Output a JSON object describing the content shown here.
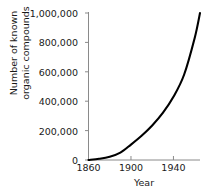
{
  "chart_data": {
    "type": "line",
    "title": "",
    "xlabel": "Year",
    "ylabel": "Number of known organic compounds",
    "ylabel_line1": "Number of known",
    "ylabel_line2": "organic compounds",
    "xlim": [
      1860,
      1965
    ],
    "ylim": [
      0,
      1000000
    ],
    "xticks": [
      1860,
      1900,
      1940
    ],
    "xtick_labels": [
      "1860",
      "1900",
      "1940"
    ],
    "yticks": [
      0,
      200000,
      400000,
      600000,
      800000,
      1000000
    ],
    "ytick_labels": [
      "0",
      "200,000",
      "400,000",
      "600,000",
      "800,000",
      "1,000,000"
    ],
    "grid": false,
    "legend": false,
    "series": [
      {
        "name": "Known organic compounds",
        "color": "#000000",
        "x": [
          1860,
          1870,
          1880,
          1890,
          1900,
          1910,
          1920,
          1930,
          1940,
          1950,
          1960,
          1965
        ],
        "values": [
          0,
          8000,
          22000,
          50000,
          105000,
          165000,
          235000,
          320000,
          430000,
          580000,
          830000,
          1000000
        ]
      }
    ]
  },
  "axes": {
    "axis_color": "#8a8a8a",
    "tick_color": "#8a8a8a",
    "text_color": "#1a1a1a",
    "background": "#ffffff"
  }
}
